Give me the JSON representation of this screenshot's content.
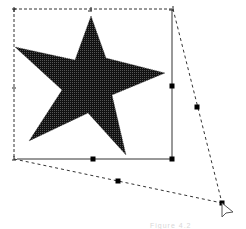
{
  "canvas": {
    "width": 246,
    "height": 229,
    "background": "#ffffff"
  },
  "shape": {
    "type": "five-point-star",
    "fill": "#111111",
    "fill_pattern": "dotted-halftone",
    "points": [
      [
        91,
        16
      ],
      [
        106,
        58
      ],
      [
        165,
        73
      ],
      [
        112,
        95
      ],
      [
        126,
        155
      ],
      [
        88,
        113
      ],
      [
        29,
        141
      ],
      [
        62,
        90
      ],
      [
        15,
        47
      ],
      [
        75,
        60
      ]
    ]
  },
  "selection": {
    "dashed_bounds": {
      "x1": 14,
      "y1": 9,
      "x2": 173,
      "y2": 159
    },
    "solid_edges": [
      [
        [
          172,
          10
        ],
        [
          172,
          159
        ]
      ],
      [
        [
          17,
          159
        ],
        [
          172,
          159
        ]
      ]
    ],
    "distort_lines": [
      [
        [
          173,
          9
        ],
        [
          222,
          203
        ]
      ],
      [
        [
          14,
          159
        ],
        [
          222,
          203
        ]
      ]
    ],
    "corner_marks": [
      [
        14,
        9
      ],
      [
        91,
        9
      ],
      [
        173,
        9
      ],
      [
        14,
        88
      ],
      [
        14,
        159
      ]
    ],
    "handles": [
      [
        93,
        159
      ],
      [
        172,
        86
      ],
      [
        172,
        159
      ],
      [
        197,
        107
      ],
      [
        118,
        181
      ],
      [
        222,
        203
      ]
    ],
    "handle_color": "#000000",
    "line_color": "#333333"
  },
  "cursor": {
    "type": "arrow-pointer",
    "x": 222,
    "y": 203
  },
  "caption": {
    "text": "Figure 4.2"
  }
}
